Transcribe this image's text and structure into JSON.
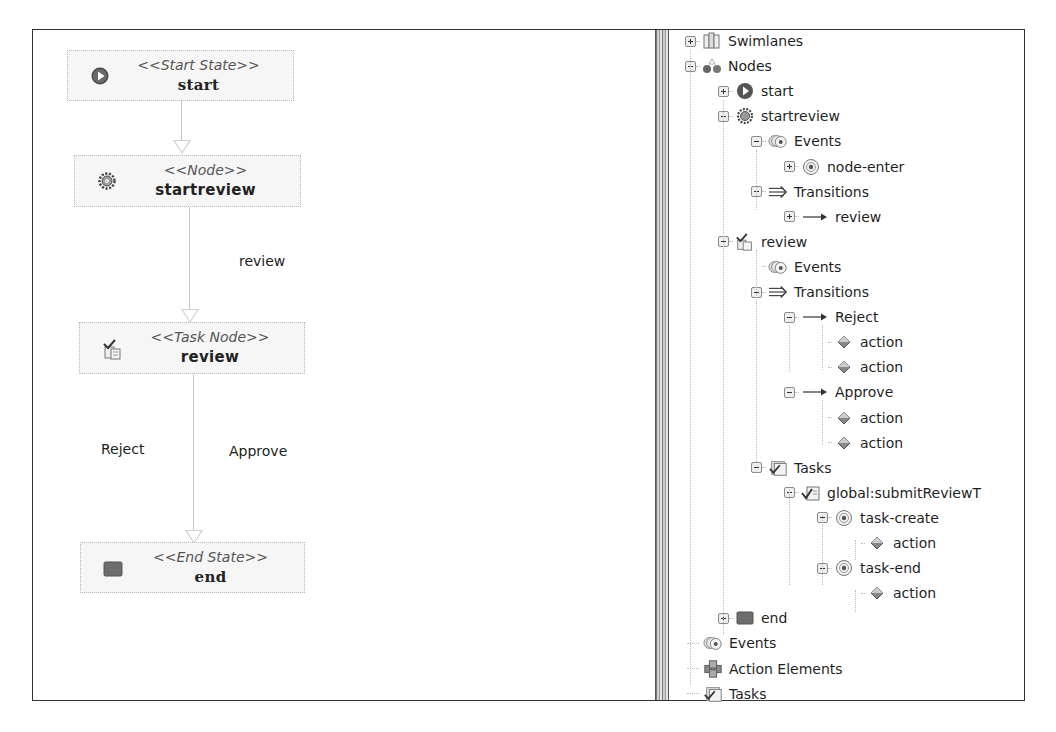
{
  "diagram": {
    "nodes": [
      {
        "id": "start",
        "stereotype": "<<Start State>>",
        "name": "start",
        "icon": "start-state-icon"
      },
      {
        "id": "startreview",
        "stereotype": "<<Node>>",
        "name": "startreview",
        "icon": "gear-icon"
      },
      {
        "id": "review",
        "stereotype": "<<Task Node>>",
        "name": "review",
        "icon": "task-node-icon"
      },
      {
        "id": "end",
        "stereotype": "<<End State>>",
        "name": "end",
        "icon": "end-state-icon"
      }
    ],
    "transitions": [
      {
        "from": "start",
        "to": "startreview",
        "label": ""
      },
      {
        "from": "startreview",
        "to": "review",
        "label": "review"
      },
      {
        "from": "review",
        "to": "end",
        "label": "Reject"
      },
      {
        "from": "review",
        "to": "end",
        "label": "Approve"
      }
    ]
  },
  "tree": {
    "rows": [
      {
        "level": 0,
        "expander": "plus",
        "icon": "swimlanes-icon",
        "label": "Swimlanes"
      },
      {
        "level": 0,
        "expander": "minus",
        "icon": "nodes-icon",
        "label": "Nodes"
      },
      {
        "level": 1,
        "expander": "plus",
        "icon": "start-state-icon",
        "label": "start"
      },
      {
        "level": 1,
        "expander": "minus",
        "icon": "gear-icon",
        "label": "startreview"
      },
      {
        "level": 2,
        "expander": "minus",
        "icon": "events-icon",
        "label": "Events"
      },
      {
        "level": 3,
        "expander": "plus",
        "icon": "event-icon",
        "label": "node-enter"
      },
      {
        "level": 2,
        "expander": "minus",
        "icon": "transitions-icon",
        "label": "Transitions"
      },
      {
        "level": 3,
        "expander": "plus",
        "icon": "arrow-right-icon",
        "label": "review"
      },
      {
        "level": 1,
        "expander": "minus",
        "icon": "task-node-icon",
        "label": "review"
      },
      {
        "level": 2,
        "expander": "none",
        "icon": "events-icon",
        "label": "Events"
      },
      {
        "level": 2,
        "expander": "minus",
        "icon": "transitions-icon",
        "label": "Transitions"
      },
      {
        "level": 3,
        "expander": "minus",
        "icon": "arrow-right-icon",
        "label": "Reject"
      },
      {
        "level": 4,
        "expander": "none",
        "icon": "action-icon",
        "label": "action"
      },
      {
        "level": 4,
        "expander": "none",
        "icon": "action-icon",
        "label": "action"
      },
      {
        "level": 3,
        "expander": "minus",
        "icon": "arrow-right-icon",
        "label": "Approve"
      },
      {
        "level": 4,
        "expander": "none",
        "icon": "action-icon",
        "label": "action"
      },
      {
        "level": 4,
        "expander": "none",
        "icon": "action-icon",
        "label": "action"
      },
      {
        "level": 2,
        "expander": "minus",
        "icon": "tasks-icon",
        "label": "Tasks"
      },
      {
        "level": 3,
        "expander": "minus",
        "icon": "task-icon",
        "label": "global:submitReviewT"
      },
      {
        "level": 4,
        "expander": "minus",
        "icon": "event-icon",
        "label": "task-create"
      },
      {
        "level": 5,
        "expander": "none",
        "icon": "action-icon",
        "label": "action"
      },
      {
        "level": 4,
        "expander": "minus",
        "icon": "event-icon",
        "label": "task-end"
      },
      {
        "level": 5,
        "expander": "none",
        "icon": "action-icon",
        "label": "action"
      },
      {
        "level": 1,
        "expander": "plus",
        "icon": "end-state-icon",
        "label": "end"
      },
      {
        "level": 0,
        "expander": "none",
        "icon": "events-icon",
        "label": "Events"
      },
      {
        "level": 0,
        "expander": "none",
        "icon": "action-elements-icon",
        "label": "Action Elements"
      },
      {
        "level": 0,
        "expander": "none",
        "icon": "tasks-icon",
        "label": "Tasks"
      }
    ]
  }
}
